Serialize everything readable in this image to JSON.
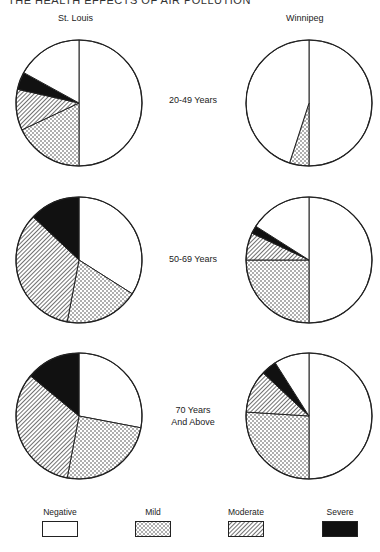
{
  "running_head": "THE HEALTH EFFECTS OF AIR POLLUTION",
  "columns": [
    "St. Louis",
    "Winnipeg"
  ],
  "rows": [
    "20-49 Years",
    "50-69 Years",
    "70 Years\nAnd Above"
  ],
  "legend": [
    {
      "label": "Negative",
      "pattern": "white"
    },
    {
      "label": "Mild",
      "pattern": "dots"
    },
    {
      "label": "Moderate",
      "pattern": "hatch"
    },
    {
      "label": "Severe",
      "pattern": "black"
    }
  ],
  "chart_data": {
    "type": "pie",
    "title": "",
    "categories": [
      "Negative",
      "Mild",
      "Moderate",
      "Severe"
    ],
    "panels": [
      {
        "city": "St. Louis",
        "age_group": "20-49 Years",
        "values": [
          67,
          18,
          10.5,
          4.5
        ]
      },
      {
        "city": "Winnipeg",
        "age_group": "20-49 Years",
        "values": [
          95,
          5,
          0,
          0
        ]
      },
      {
        "city": "St. Louis",
        "age_group": "50-69 Years",
        "values": [
          34,
          19,
          34,
          13
        ]
      },
      {
        "city": "Winnipeg",
        "age_group": "50-69 Years",
        "values": [
          66,
          25,
          7,
          2
        ]
      },
      {
        "city": "St. Louis",
        "age_group": "70 Years And Above",
        "values": [
          28,
          25,
          33,
          14
        ]
      },
      {
        "city": "Winnipeg",
        "age_group": "70 Years And Above",
        "values": [
          59,
          26,
          11,
          4
        ]
      }
    ],
    "units": "percent of subjects",
    "legend_position": "bottom"
  }
}
